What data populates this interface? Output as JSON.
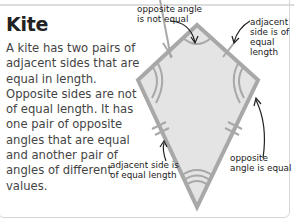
{
  "title": "Kite",
  "description": "A kite has two pairs of adjacent sides that are equal in length. Opposite sides are not of equal length. It has one pair of opposite angles that are equal and another pair of angles of different values.",
  "labels": {
    "top_left": "opposite angle is not equal",
    "top_right": "adjacent side is of equal length",
    "bottom_left": "adjacent side is of equal length",
    "bottom_right": "opposite angle is equal"
  },
  "colors": {
    "kite_fill": "#e4e4e4",
    "kite_stroke": "#a8a8a8",
    "text": "#444444",
    "title": "#222222"
  }
}
